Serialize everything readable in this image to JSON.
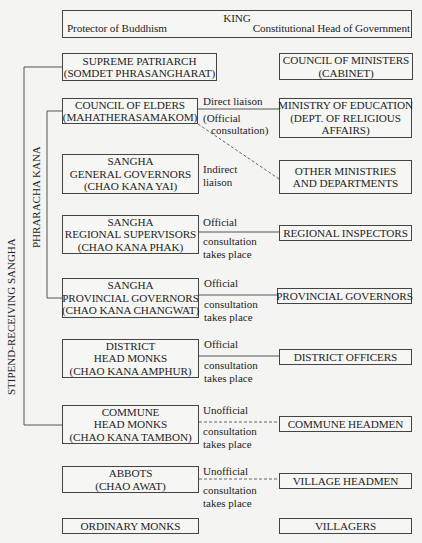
{
  "king": {
    "title": "KING",
    "left_role": "Protector of Buddhism",
    "right_role": "Constitutional Head of Government"
  },
  "side_labels": {
    "outer": "STIPEND-RECEIVING SANGHA",
    "inner": "PHRARACHA KANA"
  },
  "sangha": [
    {
      "lines": [
        "SUPREME PATRIARCH",
        "(SOMDET PHRASANGHARAT)"
      ]
    },
    {
      "lines": [
        "COUNCIL OF ELDERS",
        "(MAHATHERASAMAKOM)"
      ]
    },
    {
      "lines": [
        "SANGHA",
        "GENERAL GOVERNORS",
        "(CHAO KANA YAI)"
      ]
    },
    {
      "lines": [
        "SANGHA",
        "REGIONAL SUPERVISORS",
        "(CHAO KANA PHAK)"
      ]
    },
    {
      "lines": [
        "SANGHA",
        "PROVINCIAL GOVERNORS",
        "(CHAO KANA CHANGWAT)"
      ]
    },
    {
      "lines": [
        "DISTRICT",
        "HEAD MONKS",
        "(CHAO KANA AMPHUR)"
      ]
    },
    {
      "lines": [
        "COMMUNE",
        "HEAD MONKS",
        "(CHAO KANA TAMBON)"
      ]
    },
    {
      "lines": [
        "ABBOTS",
        "(CHAO AWAT)"
      ]
    },
    {
      "lines": [
        "ORDINARY MONKS"
      ]
    }
  ],
  "government": [
    {
      "lines": [
        "COUNCIL OF MINISTERS",
        "(CABINET)"
      ]
    },
    {
      "lines": [
        "MINISTRY OF EDUCATION",
        "(DEPT. OF RELIGIOUS",
        "AFFAIRS)"
      ]
    },
    {
      "lines": [
        "OTHER MINISTRIES",
        "AND DEPARTMENTS"
      ]
    },
    {
      "lines": [
        "REGIONAL INSPECTORS"
      ]
    },
    {
      "lines": [
        "PROVINCIAL GOVERNORS"
      ]
    },
    {
      "lines": [
        "DISTRICT OFFICERS"
      ]
    },
    {
      "lines": [
        "COMMUNE HEADMEN"
      ]
    },
    {
      "lines": [
        "VILLAGE HEADMEN"
      ]
    },
    {
      "lines": [
        "VILLAGERS"
      ]
    }
  ],
  "links": [
    {
      "above": "Direct liaison",
      "below": [
        "(Official",
        "consultation)"
      ],
      "style": "solid"
    },
    {
      "above": "Indirect",
      "below": [
        "liaison"
      ],
      "style": "dashed"
    },
    {
      "above": "Official",
      "below": [
        "consultation",
        "takes place"
      ],
      "style": "solid"
    },
    {
      "above": "Official",
      "below": [
        "consultation",
        "takes place"
      ],
      "style": "solid"
    },
    {
      "above": "Official",
      "below": [
        "consultation",
        "takes place"
      ],
      "style": "solid"
    },
    {
      "above": "Unofficial",
      "below": [
        "consultation",
        "takes place"
      ],
      "style": "dashed"
    },
    {
      "above": "Unofficial",
      "below": [
        "consultation",
        "takes place"
      ],
      "style": "dashed"
    }
  ]
}
